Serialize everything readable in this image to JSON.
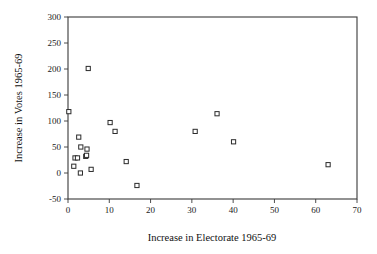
{
  "chart_data": {
    "type": "scatter",
    "title": "",
    "xlabel": "Increase in Electorate 1965-69",
    "ylabel": "Increase in Votes 1965-69",
    "xlim": [
      0,
      70
    ],
    "ylim": [
      -50,
      300
    ],
    "xticks": [
      0,
      10,
      20,
      30,
      40,
      50,
      60,
      70
    ],
    "yticks": [
      -50,
      0,
      50,
      100,
      150,
      200,
      250,
      300
    ],
    "xtick_labels": [
      "0",
      "10",
      "20",
      "30",
      "40",
      "50",
      "60",
      "70"
    ],
    "ytick_labels": [
      "-50",
      "0",
      "50",
      "100",
      "150",
      "200",
      "250",
      "300"
    ],
    "grid": false,
    "legend": null,
    "marker_style": "open-square",
    "points": [
      {
        "x": 0.2,
        "y": 118
      },
      {
        "x": 1.4,
        "y": 13
      },
      {
        "x": 1.7,
        "y": 29
      },
      {
        "x": 2.3,
        "y": 29
      },
      {
        "x": 2.6,
        "y": 69
      },
      {
        "x": 3.0,
        "y": 0
      },
      {
        "x": 3.1,
        "y": 50
      },
      {
        "x": 4.3,
        "y": 32
      },
      {
        "x": 4.5,
        "y": 34
      },
      {
        "x": 4.6,
        "y": 46
      },
      {
        "x": 4.9,
        "y": 201
      },
      {
        "x": 5.6,
        "y": 7
      },
      {
        "x": 10.2,
        "y": 97
      },
      {
        "x": 11.4,
        "y": 80
      },
      {
        "x": 14.1,
        "y": 22
      },
      {
        "x": 16.7,
        "y": -24
      },
      {
        "x": 30.8,
        "y": 80
      },
      {
        "x": 36.1,
        "y": 114
      },
      {
        "x": 40.1,
        "y": 60
      },
      {
        "x": 63.0,
        "y": 16
      }
    ]
  },
  "axes": {
    "x_title": "Increase in Electorate 1965-69",
    "y_title": "Increase in Votes 1965-69"
  }
}
